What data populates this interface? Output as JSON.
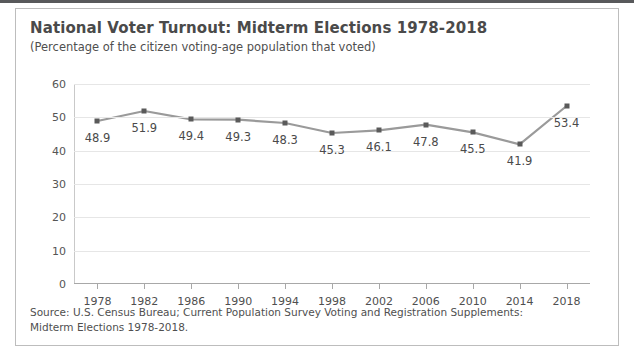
{
  "title": "National Voter Turnout: Midterm Elections 1978-2018",
  "subtitle": "(Percentage of the citizen voting-age population that voted)",
  "source": {
    "line1": "Source: U.S. Census Bureau; Current Population Survey Voting and Registration Supplements:",
    "line2": "Midterm Elections 1978-2018."
  },
  "colors": {
    "line": "#9a9a9a",
    "marker": "#5a5a5a",
    "grid": "#e6e6e6",
    "axis": "#a8a8a8",
    "text": "#4a4a4a",
    "frame": "#bdbdbd",
    "top_edge": "#58595b"
  },
  "chart_data": {
    "type": "line",
    "title": "National Voter Turnout: Midterm Elections 1978-2018",
    "subtitle": "(Percentage of the citizen voting-age population that voted)",
    "xlabel": "",
    "ylabel": "",
    "ylim": [
      0,
      60
    ],
    "yticks": [
      0,
      10,
      20,
      30,
      40,
      50,
      60
    ],
    "grid": true,
    "legend": "none",
    "markers": "square",
    "data_labels": true,
    "data_label_position": "below",
    "categories": [
      "1978",
      "1982",
      "1986",
      "1990",
      "1994",
      "1998",
      "2002",
      "2006",
      "2010",
      "2014",
      "2018"
    ],
    "values": [
      48.9,
      51.9,
      49.4,
      49.3,
      48.3,
      45.3,
      46.1,
      47.8,
      45.5,
      41.9,
      53.4
    ],
    "value_labels": [
      "48.9",
      "51.9",
      "49.4",
      "49.3",
      "48.3",
      "45.3",
      "46.1",
      "47.8",
      "45.5",
      "41.9",
      "53.4"
    ],
    "ytick_labels": [
      "0",
      "10",
      "20",
      "30",
      "40",
      "50",
      "60"
    ]
  }
}
